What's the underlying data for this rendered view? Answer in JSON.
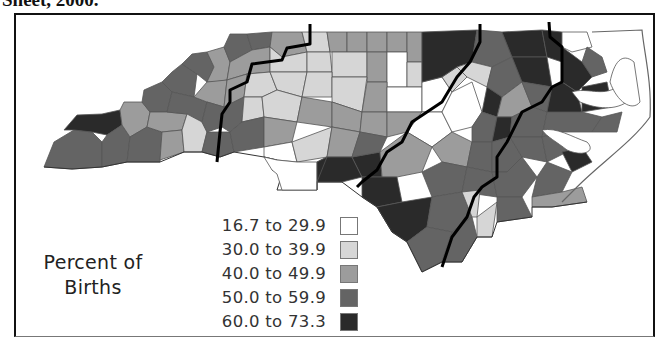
{
  "caption": "Sheet, 2000.",
  "legend": {
    "title_line1": "Percent of",
    "title_line2": "Births",
    "items": [
      {
        "label": "16.7 to 29.9",
        "color": "#ffffff"
      },
      {
        "label": "30.0 to 39.9",
        "color": "#d6d6d6"
      },
      {
        "label": "40.0 to 49.9",
        "color": "#9c9c9c"
      },
      {
        "label": "50.0 to 59.9",
        "color": "#646464"
      },
      {
        "label": "60.0 to 73.3",
        "color": "#2a2a2a"
      }
    ]
  },
  "map": {
    "subject": "North Carolina counties",
    "regions": 4,
    "colors": {
      "c1": "#ffffff",
      "c2": "#d6d6d6",
      "c3": "#9c9c9c",
      "c4": "#646464",
      "c5": "#2a2a2a",
      "county_border": "#555555",
      "region_border": "#000000"
    }
  }
}
